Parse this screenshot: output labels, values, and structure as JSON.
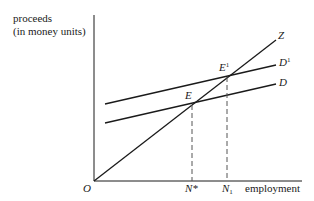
{
  "diagram": {
    "y_axis_label_line1": "proceeds",
    "y_axis_label_line2": "(in money units)",
    "x_axis_label": "employment",
    "origin_label": "O",
    "curves": {
      "z_label": "Z",
      "d1_label_base": "D",
      "d1_label_sup": "1",
      "d_label": "D"
    },
    "points": {
      "e_label": "E",
      "e1_label_base": "E",
      "e1_label_sup": "1"
    },
    "x_ticks": {
      "nstar_label": "N*",
      "n1_label_base": "N",
      "n1_label_sub": "1"
    },
    "colors": {
      "line": "#1a1a1a",
      "dashed": "#555555",
      "background": "#ffffff"
    }
  }
}
